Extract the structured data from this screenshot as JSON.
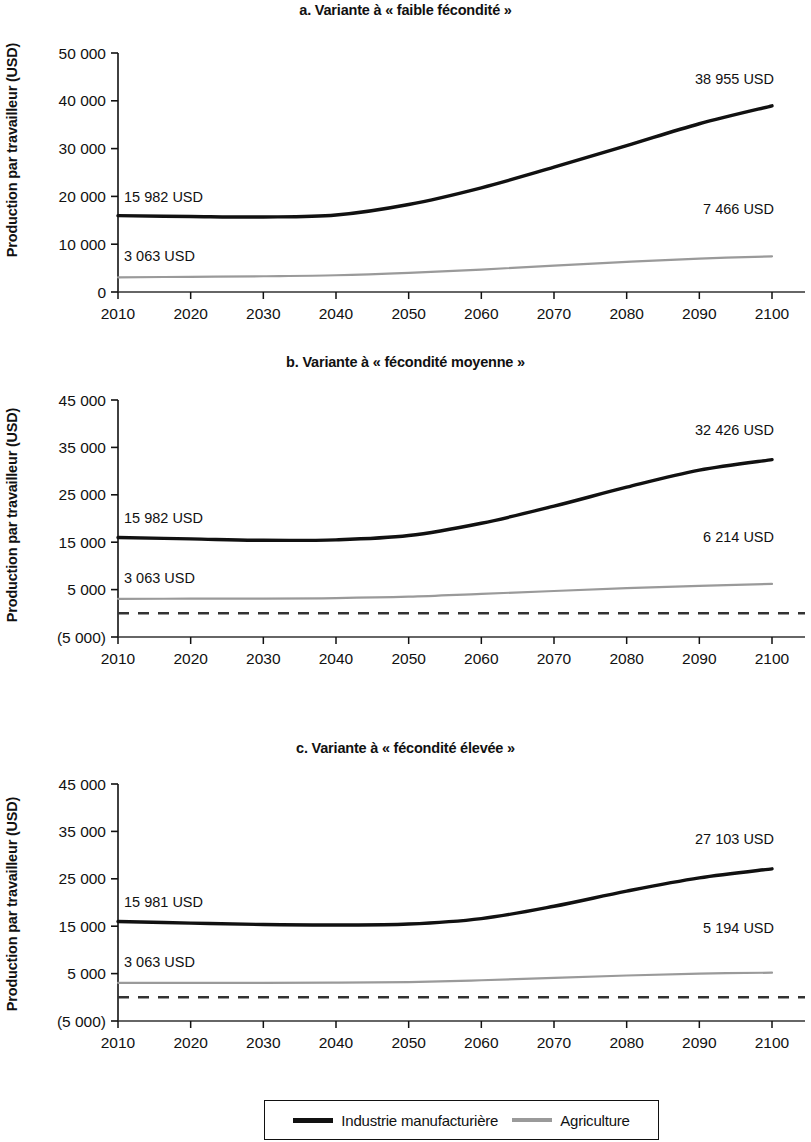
{
  "figure": {
    "ylabel": "Production par travailleur (USD)",
    "legend": {
      "manufacturing_label": "Industrie manufacturière",
      "agriculture_label": "Agriculture",
      "manufacturing_color": "#111111",
      "agriculture_color": "#9a9a9a"
    }
  },
  "chart_data": [
    {
      "type": "line",
      "id": "a",
      "title": "a. Variante à « faible fécondité »",
      "xlabel": "",
      "ylabel": "Production par travailleur (USD)",
      "x": [
        2010,
        2020,
        2030,
        2040,
        2050,
        2060,
        2070,
        2080,
        2090,
        2100
      ],
      "xticklabels": [
        "2010",
        "2020",
        "2030",
        "2040",
        "2050",
        "2060",
        "2070",
        "2080",
        "2090",
        "2100"
      ],
      "xlim": [
        2010,
        2100
      ],
      "ylim": [
        0,
        50000
      ],
      "yticks": [
        0,
        10000,
        20000,
        30000,
        40000,
        50000
      ],
      "yticklabels": [
        "0",
        "10 000",
        "20 000",
        "30 000",
        "40 000",
        "50 000"
      ],
      "grid": false,
      "legend_position": "below figure",
      "series": [
        {
          "name": "Industrie manufacturière",
          "color": "#111111",
          "style": "solid",
          "values": [
            15982,
            15800,
            15700,
            16100,
            18300,
            21800,
            26100,
            30600,
            35200,
            38955
          ]
        },
        {
          "name": "Agriculture",
          "color": "#9a9a9a",
          "style": "solid",
          "values": [
            3063,
            3180,
            3300,
            3500,
            4000,
            4700,
            5500,
            6300,
            7000,
            7466
          ]
        }
      ],
      "annotations": [
        {
          "text": "15 982 USD",
          "series": "Industrie manufacturière",
          "point": "start"
        },
        {
          "text": "38 955 USD",
          "series": "Industrie manufacturière",
          "point": "end"
        },
        {
          "text": "3 063 USD",
          "series": "Agriculture",
          "point": "start"
        },
        {
          "text": "7 466 USD",
          "series": "Agriculture",
          "point": "end"
        }
      ],
      "zero_reference_line": false
    },
    {
      "type": "line",
      "id": "b",
      "title": "b. Variante à « fécondité moyenne »",
      "xlabel": "",
      "ylabel": "Production par travailleur (USD)",
      "x": [
        2010,
        2020,
        2030,
        2040,
        2050,
        2060,
        2070,
        2080,
        2090,
        2100
      ],
      "xticklabels": [
        "2010",
        "2020",
        "2030",
        "2040",
        "2050",
        "2060",
        "2070",
        "2080",
        "2090",
        "2100"
      ],
      "xlim": [
        2010,
        2100
      ],
      "ylim": [
        -5000,
        45000
      ],
      "yticks": [
        -5000,
        5000,
        15000,
        25000,
        35000,
        45000
      ],
      "yticklabels": [
        "(5 000)",
        "5 000",
        "15 000",
        "25 000",
        "35 000",
        "45 000"
      ],
      "grid": false,
      "legend_position": "below figure",
      "series": [
        {
          "name": "Industrie manufacturière",
          "color": "#111111",
          "style": "solid",
          "values": [
            15982,
            15700,
            15400,
            15500,
            16400,
            19000,
            22600,
            26600,
            30200,
            32426
          ]
        },
        {
          "name": "Agriculture",
          "color": "#9a9a9a",
          "style": "solid",
          "values": [
            3063,
            3080,
            3100,
            3200,
            3500,
            4100,
            4700,
            5300,
            5800,
            6214
          ]
        }
      ],
      "annotations": [
        {
          "text": "15 982 USD",
          "series": "Industrie manufacturière",
          "point": "start"
        },
        {
          "text": "32 426 USD",
          "series": "Industrie manufacturière",
          "point": "end"
        },
        {
          "text": "3 063 USD",
          "series": "Agriculture",
          "point": "start"
        },
        {
          "text": "6 214 USD",
          "series": "Agriculture",
          "point": "end"
        }
      ],
      "zero_reference_line": true,
      "zero_reference_value": 0
    },
    {
      "type": "line",
      "id": "c",
      "title": "c. Variante à « fécondité élevée »",
      "xlabel": "",
      "ylabel": "Production par travailleur (USD)",
      "x": [
        2010,
        2020,
        2030,
        2040,
        2050,
        2060,
        2070,
        2080,
        2090,
        2100
      ],
      "xticklabels": [
        "2010",
        "2020",
        "2030",
        "2040",
        "2050",
        "2060",
        "2070",
        "2080",
        "2090",
        "2100"
      ],
      "xlim": [
        2010,
        2100
      ],
      "ylim": [
        -5000,
        45000
      ],
      "yticks": [
        -5000,
        5000,
        15000,
        25000,
        35000,
        45000
      ],
      "yticklabels": [
        "(5 000)",
        "5 000",
        "15 000",
        "25 000",
        "35 000",
        "45 000"
      ],
      "grid": false,
      "legend_position": "below figure",
      "series": [
        {
          "name": "Industrie manufacturière",
          "color": "#111111",
          "style": "solid",
          "values": [
            15981,
            15650,
            15350,
            15250,
            15450,
            16600,
            19200,
            22400,
            25200,
            27103
          ]
        },
        {
          "name": "Agriculture",
          "color": "#9a9a9a",
          "style": "solid",
          "values": [
            3063,
            3050,
            3050,
            3080,
            3200,
            3600,
            4100,
            4600,
            5000,
            5194
          ]
        }
      ],
      "annotations": [
        {
          "text": "15 981 USD",
          "series": "Industrie manufacturière",
          "point": "start"
        },
        {
          "text": "27 103 USD",
          "series": "Industrie manufacturière",
          "point": "end"
        },
        {
          "text": "3 063 USD",
          "series": "Agriculture",
          "point": "start"
        },
        {
          "text": "5 194 USD",
          "series": "Agriculture",
          "point": "end"
        }
      ],
      "zero_reference_line": true,
      "zero_reference_value": 0
    }
  ]
}
